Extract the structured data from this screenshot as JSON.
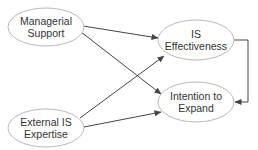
{
  "diagram": {
    "type": "path-model",
    "colors": {
      "background": "#ffffff",
      "node_stroke": "#b8b8b8",
      "node_fill": "#ffffff",
      "edge": "#444444",
      "text": "#333333"
    },
    "nodes": [
      {
        "id": "managerial_support",
        "line1": "Managerial",
        "line2": "Support",
        "cx": 46,
        "cy": 27,
        "rx": 38,
        "ry": 19
      },
      {
        "id": "external_is_expertise",
        "line1": "External IS",
        "line2": "Expertise",
        "cx": 46,
        "cy": 128,
        "rx": 38,
        "ry": 19
      },
      {
        "id": "is_effectiveness",
        "line1": "IS",
        "line2": "Effectiveness",
        "cx": 196,
        "cy": 40,
        "rx": 38,
        "ry": 20
      },
      {
        "id": "intention_to_expand",
        "line1": "Intention to",
        "line2": "Expand",
        "cx": 196,
        "cy": 102,
        "rx": 38,
        "ry": 20
      }
    ],
    "edges": [
      {
        "from": "managerial_support",
        "to": "is_effectiveness"
      },
      {
        "from": "managerial_support",
        "to": "intention_to_expand"
      },
      {
        "from": "external_is_expertise",
        "to": "is_effectiveness"
      },
      {
        "from": "external_is_expertise",
        "to": "intention_to_expand"
      },
      {
        "from": "is_effectiveness",
        "to": "intention_to_expand",
        "style": "elbow-right"
      }
    ]
  }
}
